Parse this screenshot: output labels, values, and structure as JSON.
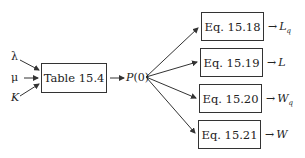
{
  "diagram": {
    "inputs": [
      {
        "symbol": "λ"
      },
      {
        "symbol": "μ"
      },
      {
        "symbol": "K"
      }
    ],
    "table_box": {
      "label": "Table 15.4"
    },
    "intermediate": {
      "label": "P(0)",
      "func": "P",
      "arg": "(0)"
    },
    "equations": [
      {
        "label": "Eq. 15.18",
        "output": "L",
        "subscript": "q"
      },
      {
        "label": "Eq. 15.19",
        "output": "L",
        "subscript": ""
      },
      {
        "label": "Eq. 15.20",
        "output": "W",
        "subscript": "q"
      },
      {
        "label": "Eq. 15.21",
        "output": "W",
        "subscript": ""
      }
    ],
    "arrow_glyph": "→",
    "colors": {
      "line": "#333333",
      "text": "#222222",
      "background": "#ffffff"
    }
  }
}
